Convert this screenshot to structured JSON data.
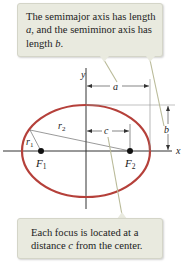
{
  "callouts": {
    "top": {
      "text_before_a": "The semimajor axis has length ",
      "var_a": "a",
      "text_mid": ", and the semiminor axis has length ",
      "var_b": "b",
      "text_end": "."
    },
    "bottom": {
      "text_before": "Each focus is located at a distance ",
      "var_c": "c",
      "text_after": " from the center."
    }
  },
  "diagram": {
    "labels": {
      "x_axis": "x",
      "y_axis": "y",
      "semimajor": "a",
      "semiminor": "b",
      "focal_distance": "c",
      "r1": "r",
      "r1_sub": "1",
      "r2": "r",
      "r2_sub": "2",
      "focus1": "F",
      "focus1_sub": "1",
      "focus2": "F",
      "focus2_sub": "2"
    },
    "colors": {
      "ellipse": "#b5403a",
      "callout_bg": "#e9eadf",
      "leader_line": "#b9ba98",
      "axis": "#333333"
    }
  }
}
